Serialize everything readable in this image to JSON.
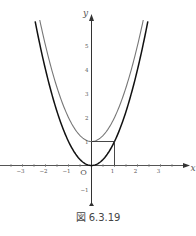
{
  "chart_data": {
    "type": "line",
    "title": "",
    "xlabel": "x",
    "ylabel": "y",
    "origin_label": "O",
    "xlim": [
      -4,
      4
    ],
    "ylim": [
      -2,
      6
    ],
    "x_ticks": [
      -3,
      -2,
      -1,
      1,
      2,
      3
    ],
    "x_tick_labels": [
      "−3",
      "−2",
      "−1",
      "1",
      "2",
      "3"
    ],
    "y_ticks": [
      -1,
      1,
      2,
      3,
      4,
      5
    ],
    "y_tick_labels": [
      "−1",
      "1",
      "2",
      "3",
      "4",
      "5"
    ],
    "grid": false,
    "series": [
      {
        "name": "y = x^2",
        "color": "#111111",
        "x_range": [
          -2.45,
          2.45
        ]
      },
      {
        "name": "y = x^2 + 1",
        "color": "#777777",
        "x_range": [
          -2.25,
          2.25
        ]
      }
    ],
    "annotations": [
      {
        "type": "segment",
        "from": [
          0,
          1
        ],
        "to": [
          1,
          1
        ]
      },
      {
        "type": "segment",
        "from": [
          1,
          1
        ],
        "to": [
          1,
          0
        ]
      }
    ]
  },
  "caption": "図 6.3.19",
  "colors": {
    "axis": "#333333",
    "curve_dark": "#111111",
    "curve_light": "#777777"
  }
}
